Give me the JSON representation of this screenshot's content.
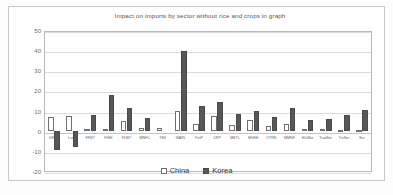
{
  "chart_data": {
    "type": "bar",
    "title": "Impact on imports by sector without rice and crops in graph",
    "xlabel": "",
    "ylabel": "% change",
    "ylim": [
      -20,
      50
    ],
    "yticks": [
      50,
      40,
      30,
      20,
      10,
      0,
      -10,
      -20
    ],
    "grid": true,
    "legend_position": "bottom",
    "categories": [
      "GRNS",
      "LveS",
      "FRST",
      "FISH",
      "FDBT",
      "MNFC",
      "TEX",
      "WAPL",
      "PetP",
      "CRP",
      "METL",
      "MVEH",
      "OTRN",
      "MMNF",
      "ElcWat",
      "TradSer",
      "TrnSer",
      "Svc"
    ],
    "series": [
      {
        "name": "China",
        "color": "#ffffff",
        "values": [
          7.0,
          7.5,
          1.3,
          1.2,
          5.0,
          1.6,
          1.6,
          10.2,
          3.8,
          7.8,
          3.0,
          5.6,
          2.5,
          3.7,
          0.9,
          0.9,
          0.7,
          0.7
        ]
      },
      {
        "name": "Korea",
        "color": "#575757",
        "values": [
          -9.5,
          -8.0,
          8.3,
          18.3,
          11.7,
          6.8,
          0.0,
          40.5,
          12.8,
          14.5,
          8.6,
          10.0,
          7.2,
          11.5,
          5.6,
          6.0,
          8.4,
          10.8
        ]
      }
    ]
  },
  "legend": {
    "items": [
      {
        "label": "China"
      },
      {
        "label": "Korea"
      }
    ]
  }
}
